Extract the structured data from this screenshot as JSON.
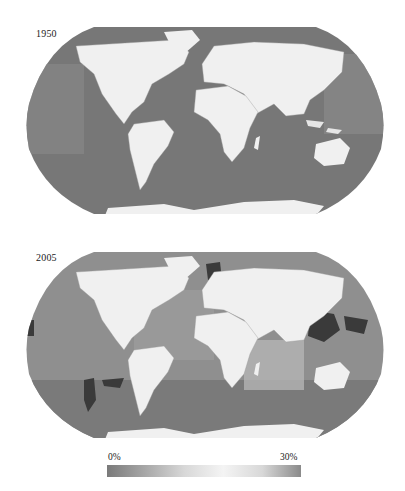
{
  "maps": [
    {
      "year_label": "1950",
      "ocean_color": "#7a7a7a",
      "land_color": "#f0f0f0"
    },
    {
      "year_label": "2005",
      "ocean_color": "#8c8c8c",
      "land_color": "#f0f0f0"
    }
  ],
  "colorbar": {
    "min_label": "0%",
    "max_label": "30%",
    "stops": [
      "#7a7a7a",
      "#a8a8a8",
      "#d8d8d8",
      "#f4f4f4",
      "#d8d8d8",
      "#8a8a8a"
    ]
  }
}
